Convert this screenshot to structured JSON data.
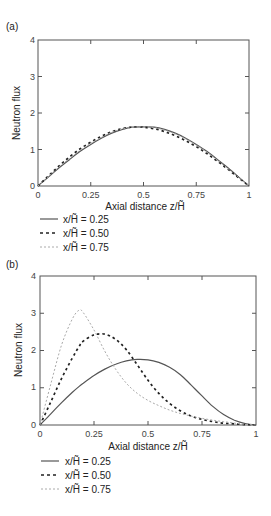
{
  "chart_data": [
    {
      "panel_label": "(a)",
      "type": "line",
      "title": "",
      "xlabel": "Axial distance z/H̃",
      "ylabel": "Neutron flux",
      "xlim": [
        0,
        1
      ],
      "ylim": [
        0,
        4
      ],
      "xticks": [
        "0",
        "0.25",
        "0.5",
        "0.75",
        "1"
      ],
      "yticks": [
        "0",
        "1",
        "2",
        "3",
        "4"
      ],
      "grid": false,
      "legend_position": "below",
      "x": [
        0,
        0.05,
        0.1,
        0.15,
        0.2,
        0.25,
        0.3,
        0.35,
        0.4,
        0.45,
        0.5,
        0.55,
        0.6,
        0.65,
        0.7,
        0.75,
        0.8,
        0.85,
        0.9,
        0.95,
        1.0
      ],
      "series": [
        {
          "name": "x/H̃ = 0.25",
          "style": "solid",
          "color": "#555555",
          "values": [
            0,
            0.25,
            0.5,
            0.73,
            0.95,
            1.14,
            1.31,
            1.45,
            1.55,
            1.61,
            1.62,
            1.61,
            1.55,
            1.45,
            1.31,
            1.14,
            0.95,
            0.73,
            0.5,
            0.25,
            0
          ]
        },
        {
          "name": "x/H̃ = 0.50",
          "style": "dashed",
          "color": "#222222",
          "values": [
            0,
            0.28,
            0.55,
            0.8,
            1.02,
            1.2,
            1.36,
            1.49,
            1.57,
            1.62,
            1.61,
            1.57,
            1.49,
            1.38,
            1.24,
            1.08,
            0.89,
            0.68,
            0.46,
            0.23,
            0
          ]
        },
        {
          "name": "x/H̃ = 0.75",
          "style": "dotted-light",
          "color": "#aaaaaa",
          "values": [
            0,
            0.26,
            0.52,
            0.76,
            0.98,
            1.17,
            1.33,
            1.47,
            1.56,
            1.61,
            1.62,
            1.6,
            1.53,
            1.43,
            1.29,
            1.12,
            0.93,
            0.71,
            0.48,
            0.24,
            0
          ]
        }
      ]
    },
    {
      "panel_label": "(b)",
      "type": "line",
      "title": "",
      "xlabel": "Axial distance z/H̃",
      "ylabel": "Neutron flux",
      "xlim": [
        0,
        1
      ],
      "ylim": [
        0,
        4
      ],
      "xticks": [
        "0",
        "0.25",
        "0.5",
        "0.75",
        "1"
      ],
      "yticks": [
        "0",
        "1",
        "2",
        "3",
        "4"
      ],
      "grid": false,
      "legend_position": "below",
      "x": [
        0,
        0.05,
        0.1,
        0.15,
        0.18,
        0.2,
        0.25,
        0.3,
        0.35,
        0.4,
        0.45,
        0.5,
        0.55,
        0.6,
        0.65,
        0.7,
        0.75,
        0.8,
        0.85,
        0.9,
        0.95,
        1.0
      ],
      "series": [
        {
          "name": "x/H̃ = 0.25",
          "style": "solid",
          "color": "#555555",
          "values": [
            0,
            0.3,
            0.6,
            0.88,
            1.03,
            1.12,
            1.33,
            1.5,
            1.63,
            1.72,
            1.76,
            1.75,
            1.68,
            1.55,
            1.35,
            1.07,
            0.78,
            0.5,
            0.28,
            0.13,
            0.04,
            0
          ]
        },
        {
          "name": "x/H̃ = 0.50",
          "style": "dashed",
          "color": "#222222",
          "values": [
            0,
            0.62,
            1.25,
            1.8,
            2.1,
            2.25,
            2.42,
            2.44,
            2.3,
            2.02,
            1.62,
            1.2,
            0.85,
            0.58,
            0.38,
            0.24,
            0.15,
            0.09,
            0.05,
            0.03,
            0.01,
            0
          ]
        },
        {
          "name": "x/H̃ = 0.75",
          "style": "dotted-light",
          "color": "#aaaaaa",
          "values": [
            0,
            1.1,
            2.15,
            2.85,
            3.08,
            3.02,
            2.55,
            1.98,
            1.5,
            1.12,
            0.85,
            0.66,
            0.52,
            0.4,
            0.31,
            0.24,
            0.18,
            0.13,
            0.09,
            0.05,
            0.02,
            0
          ]
        }
      ]
    }
  ],
  "panels": [
    {
      "label": "(a)",
      "ylabel": "Neutron flux",
      "xlabel": "Axial distance z/H̃",
      "yticks": [
        "0",
        "1",
        "2",
        "3",
        "4"
      ],
      "xticks": [
        "0",
        "0.25",
        "0.5",
        "0.75",
        "1"
      ],
      "legend": [
        "x/H̃ = 0.25",
        "x/H̃ = 0.50",
        "x/H̃ = 0.75"
      ]
    },
    {
      "label": "(b)",
      "ylabel": "Neutron flux",
      "xlabel": "Axial distance z/H̃",
      "yticks": [
        "0",
        "1",
        "2",
        "3",
        "4"
      ],
      "xticks": [
        "0",
        "0.25",
        "0.5",
        "0.75",
        "1"
      ],
      "legend": [
        "x/H̃ = 0.25",
        "x/H̃ = 0.50",
        "x/H̃ = 0.75"
      ]
    }
  ]
}
